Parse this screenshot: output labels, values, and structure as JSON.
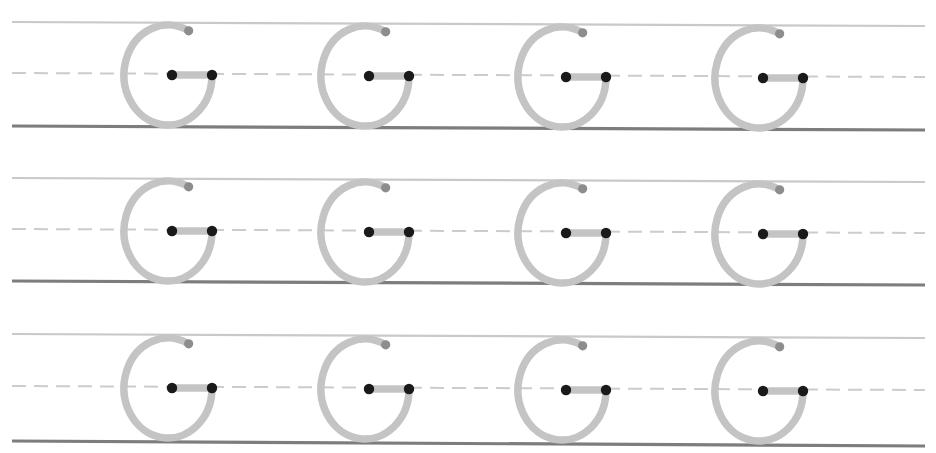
{
  "worksheet": {
    "title": "Letter G Tracing Practice Worksheet",
    "letter": "G",
    "letter_case": "uppercase",
    "rows_count": 3,
    "letters_per_row": 4,
    "total_letters": 12,
    "canvas": {
      "width": 936,
      "height": 453,
      "background": "#ffffff"
    }
  },
  "colors": {
    "background": "#ffffff",
    "top_line": "#c9c9c9",
    "mid_line_dashed": "#cccccc",
    "baseline": "#7d7d7d",
    "letter_stroke": "#c4c4c4",
    "stroke_end_dot": "#8d8d8d",
    "guide_dot": "#1a1a1a",
    "crossbar": "#c4c4c4"
  },
  "line_style": {
    "top_line_width": 2.2,
    "mid_line_width": 2.0,
    "baseline_width": 3.2,
    "dash_length": 14,
    "dash_gap": 8,
    "line_start_x": 12,
    "line_end_x": 925
  },
  "glyph_style": {
    "stroke_width": 7.5,
    "arc_radius_x": 44,
    "arc_radius_y": 50,
    "arc_gap_start_deg": -62,
    "arc_gap_end_deg": 0,
    "end_dot_radius": 4.6,
    "guide_dot_radius": 5.2,
    "crossbar_height": 7.5,
    "letter_width": 100,
    "letter_pitch": 197
  },
  "rows": [
    {
      "index": 1,
      "name": "practice-row-1",
      "top_line": {
        "y_left": 22,
        "y_right": 26
      },
      "mid_line": {
        "y_left": 73,
        "y_right": 77
      },
      "base_line": {
        "y_left": 126,
        "y_right": 130
      },
      "letters": [
        {
          "index": 1,
          "cx": 168,
          "cy": 75,
          "label": "G"
        },
        {
          "index": 2,
          "cx": 365,
          "cy": 76,
          "label": "G"
        },
        {
          "index": 3,
          "cx": 562,
          "cy": 77,
          "label": "G"
        },
        {
          "index": 4,
          "cx": 759,
          "cy": 78,
          "label": "G"
        }
      ]
    },
    {
      "index": 2,
      "name": "practice-row-2",
      "top_line": {
        "y_left": 178,
        "y_right": 182
      },
      "mid_line": {
        "y_left": 229,
        "y_right": 233
      },
      "base_line": {
        "y_left": 281,
        "y_right": 285
      },
      "letters": [
        {
          "index": 1,
          "cx": 168,
          "cy": 231,
          "label": "G"
        },
        {
          "index": 2,
          "cx": 365,
          "cy": 232,
          "label": "G"
        },
        {
          "index": 3,
          "cx": 562,
          "cy": 233,
          "label": "G"
        },
        {
          "index": 4,
          "cx": 759,
          "cy": 234,
          "label": "G"
        }
      ]
    },
    {
      "index": 3,
      "name": "practice-row-3",
      "top_line": {
        "y_left": 334,
        "y_right": 338
      },
      "mid_line": {
        "y_left": 386,
        "y_right": 390
      },
      "base_line": {
        "y_left": 441,
        "y_right": 446
      },
      "letters": [
        {
          "index": 1,
          "cx": 168,
          "cy": 388,
          "label": "G"
        },
        {
          "index": 2,
          "cx": 365,
          "cy": 389,
          "label": "G"
        },
        {
          "index": 3,
          "cx": 562,
          "cy": 390,
          "label": "G"
        },
        {
          "index": 4,
          "cx": 759,
          "cy": 391,
          "label": "G"
        }
      ]
    }
  ]
}
